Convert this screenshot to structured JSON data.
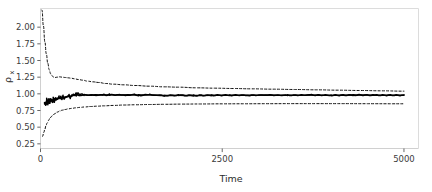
{
  "figure": {
    "background_color": "#ffffff",
    "frame_color": "#d9d9d9",
    "tick_color": "#555555"
  },
  "chart_data": {
    "type": "line",
    "title": "",
    "subtitle": "",
    "xlabel": "Time",
    "ylabel": "ρ",
    "ylabel_subscript": "x",
    "ylabel_full": "ρ_x",
    "xlim": [
      0,
      5200
    ],
    "ylim": [
      0.18,
      2.28
    ],
    "xticks": [
      0,
      2500,
      5000
    ],
    "xticklabels": [
      "0",
      "2500",
      "5000"
    ],
    "yticks": [
      0.25,
      0.5,
      0.75,
      1.0,
      1.25,
      1.5,
      1.75,
      2.0
    ],
    "yticklabels": [
      "0.25",
      "0.50",
      "0.75",
      "1.00",
      "1.25",
      "1.50",
      "1.75",
      "2.00"
    ],
    "grid": false,
    "legend": null,
    "legend_position": "none",
    "series": [
      {
        "name": "upper credible bound",
        "style": "dashed",
        "color": "#111111",
        "x": [
          20,
          40,
          60,
          80,
          100,
          120,
          140,
          160,
          180,
          200,
          230,
          260,
          300,
          340,
          380,
          420,
          470,
          520,
          580,
          650,
          720,
          800,
          900,
          1000,
          1150,
          1300,
          1500,
          1700,
          1900,
          2150,
          2400,
          2650,
          2900,
          3200,
          3500,
          3800,
          4100,
          4400,
          4700,
          5000
        ],
        "values": [
          2.26,
          2.02,
          1.78,
          1.6,
          1.46,
          1.36,
          1.3,
          1.27,
          1.25,
          1.245,
          1.25,
          1.255,
          1.25,
          1.245,
          1.24,
          1.235,
          1.225,
          1.215,
          1.205,
          1.19,
          1.18,
          1.17,
          1.155,
          1.145,
          1.135,
          1.125,
          1.115,
          1.105,
          1.1,
          1.09,
          1.085,
          1.08,
          1.075,
          1.07,
          1.065,
          1.06,
          1.055,
          1.05,
          1.045,
          1.04
        ]
      },
      {
        "name": "posterior mean",
        "style": "solid",
        "color": "#000000",
        "x": [
          55,
          70,
          85,
          100,
          115,
          130,
          145,
          160,
          175,
          190,
          210,
          230,
          255,
          280,
          310,
          340,
          375,
          410,
          450,
          490,
          540,
          600,
          680,
          760,
          850,
          950,
          1080,
          1200,
          1350,
          1500,
          1700,
          1900,
          2100,
          2350,
          2600,
          2850,
          3100,
          3400,
          3700,
          4000,
          4300,
          4600,
          5000
        ],
        "values": [
          0.87,
          0.84,
          0.9,
          0.86,
          0.9,
          0.88,
          0.92,
          0.885,
          0.915,
          0.9,
          0.93,
          0.92,
          0.945,
          0.935,
          0.955,
          0.945,
          0.965,
          0.955,
          0.975,
          0.99,
          0.975,
          0.985,
          0.98,
          0.985,
          0.982,
          0.985,
          0.983,
          0.985,
          0.982,
          0.985,
          0.975,
          0.978,
          0.975,
          0.978,
          0.98,
          0.978,
          0.982,
          0.978,
          0.982,
          0.978,
          0.982,
          0.98,
          0.978
        ]
      },
      {
        "name": "lower credible bound",
        "style": "dashed",
        "color": "#111111",
        "x": [
          28,
          45,
          60,
          75,
          90,
          110,
          130,
          150,
          175,
          200,
          230,
          265,
          300,
          340,
          385,
          430,
          485,
          545,
          610,
          690,
          780,
          880,
          1000,
          1150,
          1300,
          1500,
          1700,
          1950,
          2200,
          2500,
          2800,
          3100,
          3450,
          3800,
          4150,
          4500,
          4850,
          5000
        ],
        "values": [
          0.36,
          0.42,
          0.47,
          0.52,
          0.56,
          0.6,
          0.635,
          0.66,
          0.685,
          0.705,
          0.725,
          0.742,
          0.755,
          0.765,
          0.775,
          0.782,
          0.79,
          0.797,
          0.803,
          0.81,
          0.815,
          0.82,
          0.826,
          0.832,
          0.836,
          0.84,
          0.843,
          0.846,
          0.848,
          0.85,
          0.851,
          0.852,
          0.853,
          0.853,
          0.853,
          0.852,
          0.851,
          0.851
        ]
      }
    ]
  }
}
